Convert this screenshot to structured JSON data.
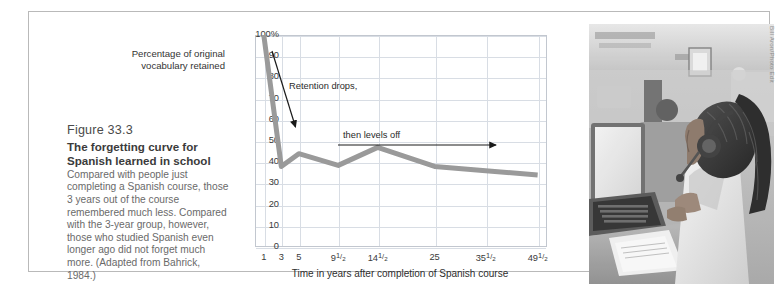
{
  "figure": {
    "number": "Figure 33.3",
    "title": "The forgetting curve for Spanish learned in school",
    "body": " Compared with people just completing a Spanish course, those 3 years out of the course remembered much less. Compared with the 3-year group, however, those who studied Spanish even longer ago did not forget much more. (Adapted from Bahrick, 1984.)"
  },
  "photo": {
    "credit": "Bill Aron/Photo Edit",
    "alt": "student-at-computer-with-headphones"
  },
  "colors": {
    "series_line": "#9a9a9a",
    "gridline": "#d8dde4",
    "plot_border": "#c2c7cf",
    "frame_border": "#b9b9b9",
    "annotation": "#1a1a1a",
    "tick_text": "#3a3a3a"
  },
  "chart_data": {
    "type": "line",
    "title": "",
    "xlabel": "Time in years after completion of Spanish course",
    "ylabel": "Percentage of original vocabulary retained",
    "categories": [
      "1",
      "3",
      "5",
      "9½",
      "14½",
      "25",
      "35½",
      "49½"
    ],
    "values": [
      100,
      38,
      44,
      38.5,
      47,
      38,
      36,
      34
    ],
    "ylim": [
      0,
      100
    ],
    "ytick_labels": [
      "100%",
      "90",
      "80",
      "70",
      "60",
      "50",
      "40",
      "30",
      "20",
      "10",
      "0"
    ],
    "ytick_values": [
      100,
      90,
      80,
      70,
      60,
      50,
      40,
      30,
      20,
      10,
      0
    ],
    "xtick_labels": [
      "1",
      "3",
      "5",
      "9½",
      "14½",
      "25",
      "35½",
      "49½"
    ],
    "grid": true,
    "legend": "none",
    "annotations": [
      {
        "text": "Retention drops,",
        "arrow": "diagonal-down-right"
      },
      {
        "text": "then levels off",
        "arrow": "horizontal-right"
      }
    ]
  }
}
